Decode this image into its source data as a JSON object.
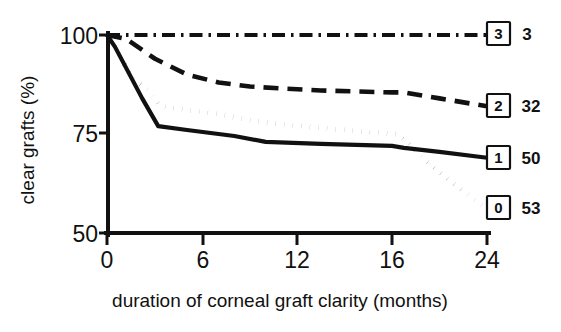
{
  "chart_data": {
    "type": "line",
    "title": "",
    "subtitle": "",
    "xlabel": "duration of corneal graft clarity (months)",
    "ylabel": "clear grafts (%)",
    "xlim": [
      0,
      24
    ],
    "ylim": [
      50,
      100
    ],
    "grid": false,
    "legend_position": "right-of-plot-at-line-ends",
    "x_ticks": [
      0,
      6,
      12,
      16,
      24
    ],
    "x_tick_labels": [
      "0",
      "6",
      "12",
      "16",
      "24"
    ],
    "x_tick_note": "non-linear spacing: equal pixel gaps between 0-6, 6-12, 12-16, 16-24",
    "y_ticks": [
      50,
      75,
      100
    ],
    "y_tick_labels": [
      "50",
      "75",
      "100"
    ],
    "series": [
      {
        "name": "3",
        "box_label": "3",
        "count_label": "3",
        "count": 3,
        "style": "dash-dot",
        "x": [
          0,
          1,
          24
        ],
        "values": [
          100,
          100,
          100
        ]
      },
      {
        "name": "2",
        "box_label": "2",
        "count_label": "32",
        "count": 32,
        "style": "dashed",
        "x": [
          0,
          1.2,
          3,
          5,
          7,
          9,
          11,
          13,
          16,
          17,
          20,
          24
        ],
        "values": [
          100,
          99,
          94,
          90,
          88,
          87,
          86.5,
          86,
          85.5,
          85.5,
          84,
          82
        ]
      },
      {
        "name": "1",
        "box_label": "1",
        "count_label": "50",
        "count": 50,
        "style": "solid",
        "x": [
          0,
          0.5,
          2.2,
          3.2,
          5,
          8,
          10,
          13,
          16,
          17,
          20,
          24
        ],
        "values": [
          100,
          97,
          84,
          77,
          76,
          74.5,
          73,
          72.5,
          72,
          71.5,
          70.5,
          69
        ]
      },
      {
        "name": "0",
        "box_label": "0",
        "count_label": "53",
        "count": 53,
        "style": "dotted",
        "x": [
          0,
          0.6,
          1.6,
          2.6,
          3.4,
          5,
          7,
          9,
          11,
          13,
          15,
          16.4,
          17.2,
          19,
          21,
          24
        ],
        "values": [
          100,
          96,
          89,
          86,
          82,
          81,
          80,
          78.5,
          77.5,
          76.5,
          75.5,
          75,
          73,
          68,
          63,
          56
        ]
      }
    ]
  },
  "axes": {
    "y_axis_name": "clear-grafts-percent-axis",
    "x_axis_name": "duration-months-axis"
  }
}
